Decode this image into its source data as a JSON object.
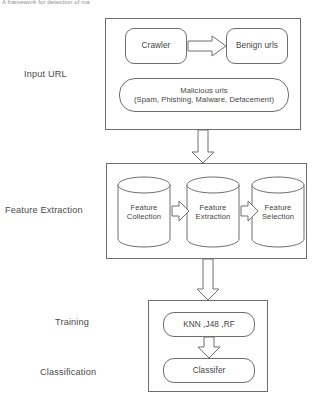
{
  "page": {
    "caption_sliver": "A framework for detection of malicious URLs"
  },
  "stage_labels": {
    "input": "Input URL",
    "feature_extraction": "Feature Extraction",
    "training": "Training",
    "classification": "Classification"
  },
  "diagram": {
    "type": "flowchart",
    "orientation": "vertical",
    "stages": [
      {
        "id": "input-url",
        "label": "Input URL",
        "nodes": [
          {
            "id": "crawler",
            "label": "Crawler",
            "shape": "rounded-rect"
          },
          {
            "id": "benign-urls",
            "label": "Benign urls",
            "shape": "rounded-rect"
          },
          {
            "id": "malicious-urls",
            "shape": "rounded-rect",
            "label_line1": "Malicious urls",
            "label_line2": "(Spam, Phishing, Malware, Defacement)"
          }
        ]
      },
      {
        "id": "feature-extraction",
        "label": "Feature Extraction",
        "nodes": [
          {
            "id": "feature-collection",
            "shape": "cylinder",
            "label_line1": "Feature",
            "label_line2": "Collection"
          },
          {
            "id": "feature-extraction-db",
            "shape": "cylinder",
            "label_line1": "Feature",
            "label_line2": "Extraction"
          },
          {
            "id": "feature-selection",
            "shape": "cylinder",
            "label_line1": "Feature",
            "label_line2": "Selection"
          }
        ]
      },
      {
        "id": "training-classification",
        "labels": [
          "Training",
          "Classification"
        ],
        "nodes": [
          {
            "id": "algorithms",
            "label": "KNN ,J48 ,RF",
            "shape": "rounded-rect"
          },
          {
            "id": "classifier",
            "label": "Classifer",
            "shape": "rounded-rect"
          }
        ]
      }
    ],
    "connectors": [
      {
        "id": "crawler-to-benign",
        "direction": "right",
        "style": "block-arrow"
      },
      {
        "id": "input-to-feature",
        "direction": "down",
        "style": "block-arrow"
      },
      {
        "id": "collection-to-extraction",
        "direction": "right",
        "style": "block-arrow"
      },
      {
        "id": "extraction-to-selection",
        "direction": "right",
        "style": "block-arrow"
      },
      {
        "id": "feature-to-training",
        "direction": "down",
        "style": "block-arrow"
      },
      {
        "id": "algorithms-to-classifier",
        "direction": "down",
        "style": "block-arrow"
      }
    ]
  },
  "colors": {
    "stroke": "#6e6e6e",
    "text": "#3f3f3f",
    "background": "#ffffff"
  }
}
